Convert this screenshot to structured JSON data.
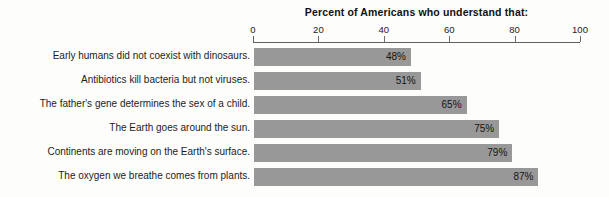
{
  "chart_data": {
    "type": "bar",
    "orientation": "horizontal",
    "title": "Percent of Americans who understand that:",
    "xlabel": "",
    "ylabel": "",
    "xlim": [
      0,
      100
    ],
    "grid": false,
    "legend": "none",
    "axis_ticks": [
      {
        "label": "0",
        "value": 0
      },
      {
        "label": "20",
        "value": 20
      },
      {
        "label": "40",
        "value": 40
      },
      {
        "label": "60",
        "value": 60
      },
      {
        "label": "80",
        "value": 80
      },
      {
        "label": "100",
        "value": 100
      }
    ],
    "bar_color": "#989898",
    "categories": [
      "Early humans did not coexist with dinosaurs.",
      "Antibiotics kill bacteria but not viruses.",
      "The father's gene determines the sex of a child.",
      "The Earth goes around the sun.",
      "Continents are moving on the Earth's surface.",
      "The oxygen we breathe comes from plants."
    ],
    "values": [
      48,
      51,
      65,
      75,
      79,
      87
    ],
    "value_labels": [
      "48%",
      "51%",
      "65%",
      "75%",
      "79%",
      "87%"
    ]
  }
}
